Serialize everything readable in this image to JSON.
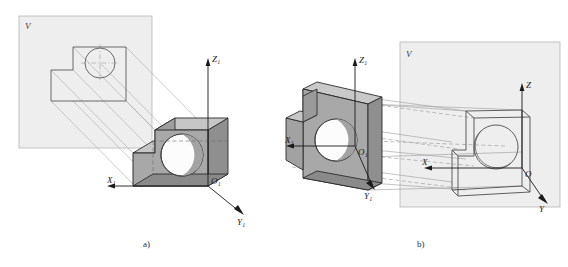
{
  "figure": {
    "background_color": "#ffffff",
    "panels": [
      {
        "id": "a",
        "caption": "a)",
        "description": "Object positioned in front of the V projection plane; projection rays run obliquely from the object to its outline on V",
        "plane": {
          "label": "V",
          "fill_color": "#eeeeee",
          "stroke_color": "#b4b4b4"
        },
        "axes": {
          "origin_label": "O₁",
          "x_label": "X₁",
          "y_label": "Y₁",
          "z_label": "Z₁"
        },
        "solid": {
          "front_face_color": "#a8a8a8",
          "top_face_color": "#c0c0c0",
          "side_face_color": "#8f8f8f",
          "hole_color": "#fbfbfb",
          "edge_color": "#2d2d2d"
        },
        "projection_line_color": "#a9a9a9"
      },
      {
        "id": "b",
        "caption": "b)",
        "description": "Object translated so its projection rays strike the V plane, producing the wireframe image on V with axes X, Y, Z and origin O",
        "plane": {
          "label": "V",
          "fill_color": "#eeeeee",
          "stroke_color": "#b4b4b4"
        },
        "axes_object": {
          "origin_label": "O₁",
          "x_label": "X₁",
          "y_label": "Y₁",
          "z_label": "Z₁"
        },
        "axes_image": {
          "origin_label": "O",
          "x_label": "X",
          "y_label": "Y",
          "z_label": "Z"
        },
        "solid": {
          "front_face_color": "#a8a8a8",
          "top_face_color": "#c0c0c0",
          "side_face_color": "#8f8f8f",
          "hole_color": "#fbfbfb",
          "edge_color": "#2d2d2d"
        },
        "projection_line_color": "#9a9a9a",
        "hidden_line_style": "dashed"
      }
    ]
  }
}
